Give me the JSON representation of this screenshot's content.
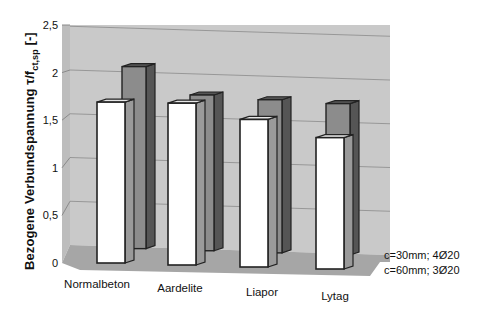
{
  "chart_data": {
    "type": "bar",
    "subtype": "3d-clustered-depth",
    "title": "",
    "xlabel": "",
    "ylabel": "Bezogene Verbundspannung τ/f_ct,sp [-]",
    "ylabel_parts": {
      "main": "Bezogene Verbundspannung τ/f",
      "sub": "ct,sp",
      "unit": " [-]"
    },
    "ylim": [
      0,
      2.5
    ],
    "yticks": [
      "0",
      "0,5",
      "1",
      "1,5",
      "2",
      "2,5"
    ],
    "ytick_values": [
      0,
      0.5,
      1,
      1.5,
      2,
      2.5
    ],
    "grid": true,
    "legend_position": "bottom-right",
    "categories": [
      "Normalbeton",
      "Aardelite",
      "Liapor",
      "Lytag"
    ],
    "series": [
      {
        "name": "c=30mm; 4Ø20",
        "values": [
          1.69,
          1.7,
          1.55,
          1.38
        ],
        "color": "#ffffff"
      },
      {
        "name": "c=60mm; 3Ø20",
        "values": [
          2.08,
          1.78,
          1.75,
          1.73
        ],
        "color": "#8c8c8c"
      }
    ]
  },
  "colors": {
    "wall": "#c9c9c9",
    "side_wall": "#bdbdbd",
    "floor": "#a6a6a6",
    "front_bar": "#ffffff",
    "front_bar_side": "#9a9a9a",
    "back_bar": "#8c8c8c",
    "back_bar_side": "#555555",
    "outline": "#222222",
    "grid": "#8a8a8a"
  }
}
